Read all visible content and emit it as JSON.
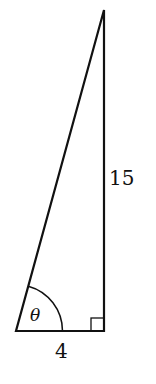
{
  "diagram": {
    "type": "right-triangle",
    "labels": {
      "vertical_side": "15",
      "horizontal_side": "4",
      "angle": "θ"
    },
    "right_angle_marker": true,
    "line_color": "#111111",
    "vertices": {
      "bottom_left": [
        16,
        331
      ],
      "bottom_right": [
        104,
        331
      ],
      "top": [
        104,
        10
      ]
    }
  }
}
